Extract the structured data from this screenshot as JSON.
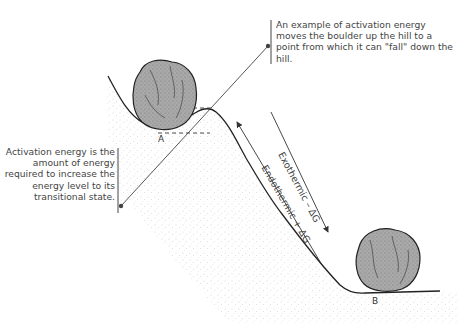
{
  "callouts": {
    "top": "An example of activation energy moves the boulder up the hill to a point from which it can \"fall\" down the hill.",
    "left": "Activation energy is the amount of energy required to increase the energy level to its transitional state."
  },
  "labels": {
    "point_a": "A",
    "point_b": "B"
  },
  "arrows": {
    "exothermic": "Exothermic – ΔG",
    "endothermic": "Endothermic + ΔG"
  },
  "colors": {
    "line": "#333333",
    "boulder": "#9a9a9a",
    "boulder_dark": "#555555",
    "ground_stipple": "#b5b5b5"
  }
}
